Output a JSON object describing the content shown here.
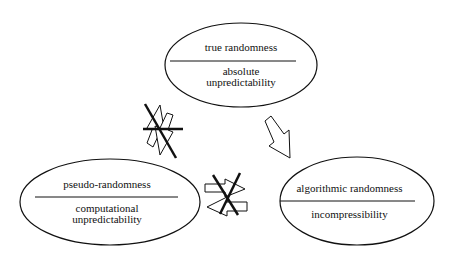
{
  "diagram": {
    "nodes": [
      {
        "id": "true",
        "title": "true randomness",
        "subtitle_lines": [
          "absolute",
          "unpredictability"
        ]
      },
      {
        "id": "pseudo",
        "title": "pseudo-randomness",
        "subtitle_lines": [
          "computational",
          "unpredictability"
        ]
      },
      {
        "id": "algorithmic",
        "title": "algorithmic randomness",
        "subtitle_lines": [
          "incompressibility"
        ]
      }
    ],
    "edges": [
      {
        "from": "true",
        "to": "pseudo",
        "type": "bidirectional",
        "crossed_out": true
      },
      {
        "from": "true",
        "to": "algorithmic",
        "type": "implies",
        "crossed_out": false
      },
      {
        "from": "pseudo",
        "to": "algorithmic",
        "type": "bidirectional",
        "crossed_out": true
      }
    ],
    "colors": {
      "stroke": "#111111",
      "background": "#ffffff"
    }
  }
}
